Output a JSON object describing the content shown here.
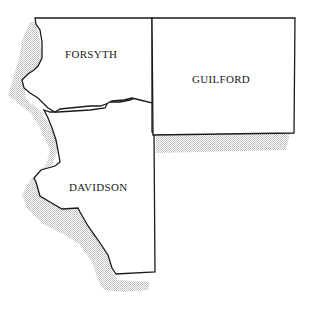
{
  "map": {
    "regions": [
      {
        "id": "forsyth",
        "label": "FORSYTH"
      },
      {
        "id": "guilford",
        "label": "GUILFORD"
      },
      {
        "id": "davidson",
        "label": "DAVIDSON"
      }
    ],
    "colors": {
      "outline": "#1a1a1a",
      "shadow": "#c8c8c8",
      "fill": "#ffffff"
    }
  }
}
